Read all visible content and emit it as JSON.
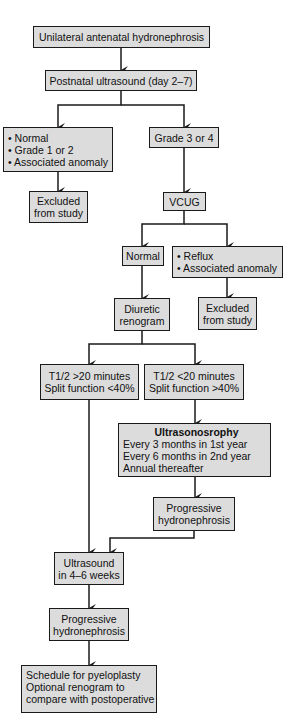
{
  "diagram": {
    "nodes": {
      "start": {
        "lines": [
          "Unilateral antenatal hydronephrosis"
        ]
      },
      "postnatal_us": {
        "lines": [
          "Postnatal ultrasound (day 2–7)"
        ]
      },
      "normal_grade12": {
        "lines": [
          "• Normal",
          "• Grade 1 or 2",
          "• Associated anomaly"
        ]
      },
      "excluded_1": {
        "lines": [
          "Excluded",
          "from study"
        ]
      },
      "grade34": {
        "lines": [
          "Grade 3 or 4"
        ]
      },
      "vcug": {
        "lines": [
          "VCUG"
        ]
      },
      "vcug_normal": {
        "lines": [
          "Normal"
        ]
      },
      "reflux": {
        "lines": [
          "• Reflux",
          "• Associated anomaly"
        ]
      },
      "excluded_2": {
        "lines": [
          "Excluded",
          "from study"
        ]
      },
      "diuretic_renogram": {
        "lines": [
          "Diuretic",
          "renogram"
        ]
      },
      "t12_gt20": {
        "lines": [
          "T1/2 >20 minutes",
          "Split function <40%"
        ]
      },
      "t12_lt20": {
        "lines": [
          "T1/2 <20 minutes",
          "Split function >40%"
        ]
      },
      "ultrasonography": {
        "title": "Ultrasonosrophy",
        "lines": [
          "Every 3 months in 1st year",
          "Every 6 months in 2nd year",
          "Annual thereafter"
        ]
      },
      "progressive_1": {
        "lines": [
          "Progressive",
          "hydronephrosis"
        ]
      },
      "us_4_6_weeks": {
        "lines": [
          "Ultrasound",
          "in 4–6 weeks"
        ]
      },
      "progressive_2": {
        "lines": [
          "Progressive",
          "hydronephrosis"
        ]
      },
      "schedule_pyeloplasty": {
        "lines": [
          "Schedule for pyeloplasty",
          "Optional renogram to",
          "compare with postoperative"
        ]
      }
    },
    "edges": [
      [
        "start",
        "postnatal_us"
      ],
      [
        "postnatal_us",
        "normal_grade12"
      ],
      [
        "postnatal_us",
        "grade34"
      ],
      [
        "normal_grade12",
        "excluded_1"
      ],
      [
        "grade34",
        "vcug"
      ],
      [
        "vcug",
        "vcug_normal"
      ],
      [
        "vcug",
        "reflux"
      ],
      [
        "reflux",
        "excluded_2"
      ],
      [
        "vcug_normal",
        "diuretic_renogram"
      ],
      [
        "diuretic_renogram",
        "t12_gt20"
      ],
      [
        "diuretic_renogram",
        "t12_lt20"
      ],
      [
        "t12_lt20",
        "ultrasonography"
      ],
      [
        "ultrasonography",
        "progressive_1"
      ],
      [
        "t12_gt20",
        "us_4_6_weeks"
      ],
      [
        "progressive_1",
        "us_4_6_weeks"
      ],
      [
        "us_4_6_weeks",
        "progressive_2"
      ],
      [
        "progressive_2",
        "schedule_pyeloplasty"
      ]
    ],
    "colors": {
      "box_fill": "#dcdcdc",
      "box_border": "#1a1a1a",
      "connector": "#1a1a1a"
    }
  }
}
